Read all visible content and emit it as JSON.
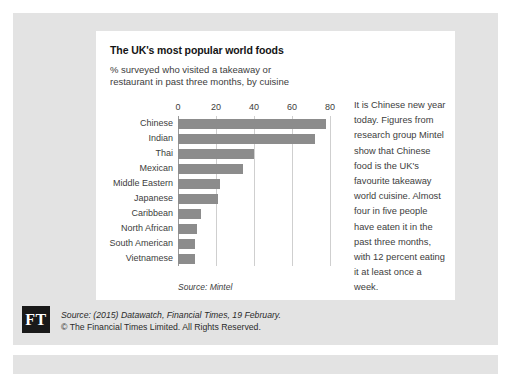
{
  "card": {
    "title": "The UK's most popular world foods",
    "subtitle": "% surveyed who visited a takeaway or restaurant in past three months, by cuisine",
    "source_note": "Source: Mintel"
  },
  "side_text": "It is Chinese new year today. Figures from research group Mintel show that Chinese food is the UK's favourite takeaway world cuisine. Almost four in five people have eaten it in the past three months, with 12 percent eating it at least once a week.",
  "footer": {
    "logo": "FT",
    "line1_prefix": "Source: (2015) Datawatch, ",
    "line1_italic": "Financial Times",
    "line1_suffix": ", 19 February.",
    "line2": "© The Financial Times Limited. All Rights Reserved."
  },
  "colors": {
    "bar": "#8c8c8c",
    "panel": "#e3e3e3",
    "card": "#ffffff",
    "grid": "#cfcfcf",
    "axis": "#9a9a9a",
    "logo_bg": "#191919"
  },
  "chart_data": {
    "type": "bar",
    "orientation": "horizontal",
    "title": "The UK's most popular world foods",
    "subtitle": "% surveyed who visited a takeaway or restaurant in past three months, by cuisine",
    "xlabel": "",
    "ylabel": "",
    "xlim": [
      0,
      80
    ],
    "xticks": [
      0,
      20,
      40,
      60,
      80
    ],
    "grid": true,
    "legend": false,
    "categories": [
      "Chinese",
      "Indian",
      "Thai",
      "Mexican",
      "Middle Eastern",
      "Japanese",
      "Caribbean",
      "North African",
      "South American",
      "Vietnamese"
    ],
    "values": [
      78,
      72,
      40,
      34,
      22,
      21,
      12,
      10,
      9,
      9
    ],
    "source": "Source: Mintel"
  }
}
